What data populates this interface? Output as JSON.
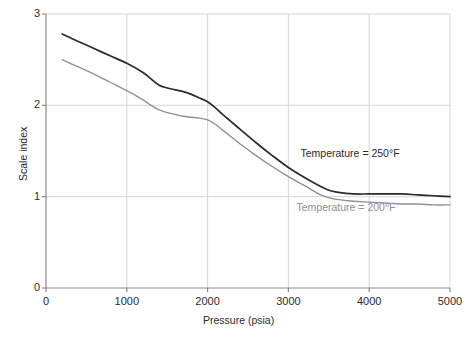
{
  "chart_data": {
    "type": "line",
    "title": "",
    "xlabel": "Pressure (psia)",
    "ylabel": "Scale index",
    "xlim": [
      0,
      5000
    ],
    "ylim": [
      0,
      3
    ],
    "xticks": [
      0,
      1000,
      2000,
      3000,
      4000,
      5000
    ],
    "xtick_labels": [
      "0",
      "1000",
      "2000",
      "3000",
      "4000",
      "5000"
    ],
    "yticks": [
      0,
      1,
      2,
      3
    ],
    "ytick_labels": [
      "0",
      "1",
      "2",
      "3"
    ],
    "grid": true,
    "legend_position": "inline-annotation",
    "series": [
      {
        "name": "Temperature = 250°F",
        "color": "#2a2a2a",
        "annotation": "Temperature = 250°F",
        "x": [
          200,
          400,
          600,
          800,
          1000,
          1200,
          1300,
          1400,
          1500,
          1600,
          1700,
          1800,
          1900,
          2000,
          2100,
          2200,
          2400,
          2600,
          2800,
          3000,
          3200,
          3400,
          3500,
          3600,
          3800,
          4000,
          4200,
          4400,
          4600,
          4800,
          5000
        ],
        "y": [
          2.78,
          2.7,
          2.62,
          2.54,
          2.46,
          2.36,
          2.29,
          2.22,
          2.19,
          2.17,
          2.15,
          2.12,
          2.08,
          2.04,
          1.97,
          1.89,
          1.74,
          1.59,
          1.45,
          1.32,
          1.21,
          1.11,
          1.07,
          1.05,
          1.03,
          1.03,
          1.03,
          1.03,
          1.02,
          1.01,
          1.0
        ]
      },
      {
        "name": "Temperature = 200°F",
        "color": "#909090",
        "annotation": "Temperature = 200°F",
        "x": [
          200,
          400,
          600,
          800,
          1000,
          1200,
          1300,
          1400,
          1500,
          1600,
          1700,
          1800,
          1900,
          2000,
          2100,
          2200,
          2400,
          2600,
          2800,
          3000,
          3200,
          3400,
          3500,
          3600,
          3800,
          4000,
          4200,
          4400,
          4600,
          4800,
          5000
        ],
        "y": [
          2.5,
          2.42,
          2.34,
          2.25,
          2.16,
          2.06,
          2.0,
          1.95,
          1.92,
          1.9,
          1.88,
          1.87,
          1.86,
          1.84,
          1.79,
          1.72,
          1.58,
          1.45,
          1.33,
          1.22,
          1.12,
          1.02,
          0.99,
          0.97,
          0.95,
          0.94,
          0.93,
          0.92,
          0.92,
          0.91,
          0.91
        ]
      }
    ],
    "annotations": [
      {
        "text": "Temperature = 250°F",
        "x": 3150,
        "y": 1.47,
        "color": "#2a2a2a"
      },
      {
        "text": "Temperature = 200°F",
        "x": 3100,
        "y": 0.88,
        "color": "#909090"
      }
    ]
  },
  "axes": {
    "x_title": "Pressure (psia)",
    "y_title": "Scale index"
  },
  "colors": {
    "series_250F": "#2a2a2a",
    "series_200F": "#909090",
    "grid": "#d6d6d6",
    "axis": "#8a8a8a",
    "background": "#ffffff"
  }
}
